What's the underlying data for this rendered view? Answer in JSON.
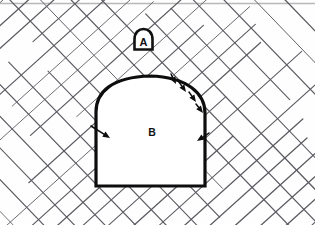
{
  "figure": {
    "type": "technical-diagram",
    "canvas": {
      "width": 315,
      "height": 225,
      "background_color": "#fefefe"
    },
    "top_rule": {
      "present": true,
      "color": "#b8b8b8",
      "y": 3
    },
    "labels": [
      {
        "id": "A",
        "text": "A",
        "role": "marker-label",
        "x": 143,
        "y": 41,
        "font_size": 11,
        "color": "#111111",
        "marker_shape": "tunnel-arch-outline",
        "marker_fill": "#ffffff",
        "marker_stroke": "#111111",
        "marker_stroke_width": 2.6,
        "marker_box": {
          "x": 133,
          "y": 28,
          "width": 21,
          "height": 22
        }
      },
      {
        "id": "B",
        "text": "B",
        "role": "region-label",
        "x": 152,
        "y": 132,
        "font_size": 10,
        "color": "#111111"
      }
    ],
    "tunnel_outline": {
      "name": "tunnel-cross-section",
      "stroke_color": "#0d0d0d",
      "stroke_width": 3.2,
      "fill": "#ffffff",
      "geometry": {
        "left_wall_x": 96,
        "right_wall_x": 205,
        "floor_y": 186,
        "springline_y": 112,
        "crown_y": 76,
        "crown_center_x": 150
      },
      "path": "M 96 186 L 96 112 C 96 92 112 77 150 76 C 188 77 205 94 205 113 L 205 186 Z"
    },
    "hatching": {
      "name": "rock-joint-hatching",
      "description": "two crossing families of straight joint traces",
      "stroke_color": "#5c5c63",
      "stroke_width": 1.05,
      "families": [
        {
          "name": "joint-set-1",
          "angle_deg": -42,
          "spacing": 17
        },
        {
          "name": "joint-set-2",
          "angle_deg": 46,
          "spacing": 22
        }
      ]
    },
    "arrows": {
      "name": "deformation-arrows",
      "description": "short solid arrows directed into the excavation",
      "color": "#0d0d0d",
      "items": [
        {
          "id": "arrow-crown-right",
          "x1": 171,
          "y1": 74,
          "x2": 176,
          "y2": 84
        },
        {
          "id": "arrow-arch-upper-right",
          "x1": 179,
          "y1": 82,
          "x2": 186,
          "y2": 92
        },
        {
          "id": "arrow-arch-mid-right",
          "x1": 189,
          "y1": 92,
          "x2": 196,
          "y2": 102
        },
        {
          "id": "arrow-arch-lower-right",
          "x1": 196,
          "y1": 104,
          "x2": 203,
          "y2": 113
        },
        {
          "id": "arrow-wall-right",
          "x1": 209,
          "y1": 133,
          "x2": 197,
          "y2": 141
        },
        {
          "id": "arrow-wall-left",
          "x1": 91,
          "y1": 126,
          "x2": 110,
          "y2": 138
        }
      ]
    }
  }
}
